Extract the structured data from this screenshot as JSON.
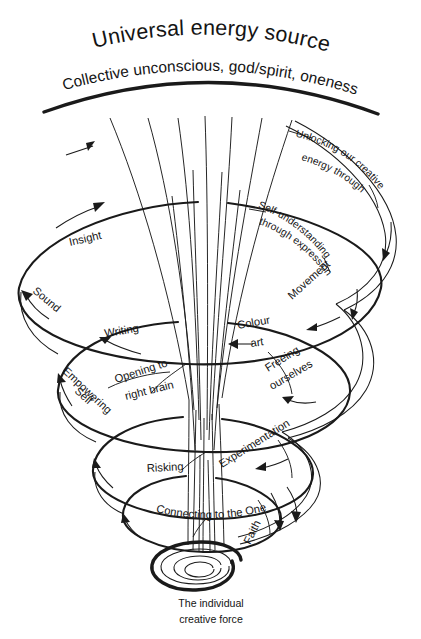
{
  "diagram": {
    "title": "Universal energy source",
    "subtitle": "Collective unconscious, god/spirit, oneness",
    "caption_line1": "The individual",
    "caption_line2": "creative force",
    "ink_color": "#1a1a1a",
    "background_color": "#ffffff",
    "labels": {
      "unlocking_l1": "Unlocking our creative",
      "unlocking_l2": "energy through",
      "insight": "Insight",
      "self_understanding_l1": "Self-understanding",
      "self_understanding_l2": "through expression",
      "movement": "Movement",
      "sound": "Sound",
      "writing": "Writing",
      "colour": "Colour",
      "art": "art",
      "opening_l1": "Opening to",
      "opening_l2": "right brain",
      "empowering": "Empowering",
      "self": "Self",
      "freeing_l1": "Freeing",
      "freeing_l2": "ourselves",
      "experimentation": "Experimentation",
      "risking": "Risking",
      "connecting": "Connecting to the One",
      "faith": "Faith"
    }
  }
}
